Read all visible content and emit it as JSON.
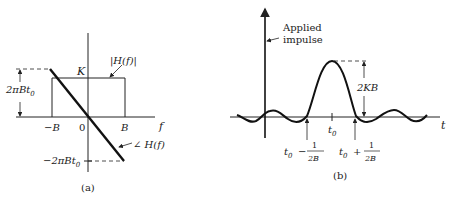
{
  "figure_a": {
    "caption": "(a)",
    "axis_label_f": "f",
    "tick_neg_B": "−B",
    "tick_zero": "0",
    "tick_B": "B",
    "level_K": "K",
    "magnitude_label": "|H(f)|",
    "phase_label": "∠ H(f)",
    "phase_top_label": "2πBt",
    "phase_top_sub": "0",
    "phase_bottom_label": "−2πBt",
    "phase_bottom_sub": "0"
  },
  "figure_b": {
    "caption": "(b)",
    "axis_label_t": "t",
    "impulse_label_line1": "Applied",
    "impulse_label_line2": "impulse",
    "peak_label": "2KB",
    "center_tick": "t",
    "center_tick_sub": "0",
    "left_zero_label_t": "t",
    "left_zero_label_sub": "0",
    "left_zero_op": "−",
    "right_zero_label_t": "t",
    "right_zero_label_sub": "0",
    "right_zero_op": "+",
    "frac_num": "1",
    "frac_den": "2B"
  },
  "colors": {
    "ink": "#222222",
    "background": "#ffffff"
  }
}
